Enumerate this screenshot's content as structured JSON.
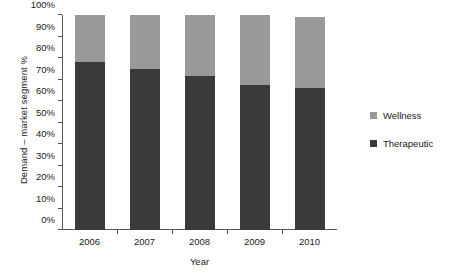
{
  "chart_data": {
    "type": "bar",
    "stacked": true,
    "normalized_percent": true,
    "title": "",
    "subtitle": "",
    "xlabel": "Year",
    "ylabel": "Demand – market segment %",
    "categories": [
      "2006",
      "2007",
      "2008",
      "2009",
      "2010"
    ],
    "series": [
      {
        "name": "Therapeutic",
        "color": "#3a3a3a",
        "values": [
          78,
          75,
          71.5,
          67.5,
          66
        ]
      },
      {
        "name": "Wellness",
        "color": "#999999",
        "values": [
          22,
          25,
          28.5,
          32.5,
          33
        ]
      }
    ],
    "bar_totals": [
      100,
      100,
      100,
      100,
      99
    ],
    "ylim": [
      0,
      100
    ],
    "ytick_labels": [
      "0%",
      "10%",
      "20%",
      "30%",
      "40%",
      "50%",
      "60%",
      "70%",
      "80%",
      "90%",
      "100%"
    ],
    "ytick_values": [
      0,
      10,
      20,
      30,
      40,
      50,
      60,
      70,
      80,
      90,
      100
    ],
    "grid": false,
    "legend_position": "right",
    "legend_entries": [
      {
        "label": "Wellness",
        "color": "#999999"
      },
      {
        "label": "Therapeutic",
        "color": "#3a3a3a"
      }
    ]
  }
}
